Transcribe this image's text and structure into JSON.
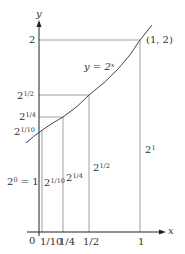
{
  "figure": {
    "curve_label": "y = 2",
    "curve_label_sup": "x",
    "point_label": "(1, 2)",
    "x_axis_label": "x",
    "y_axis_label": "y",
    "origin_label": "0",
    "line_color": "#555555",
    "curve_color": "#444444"
  },
  "y_ticks": [
    {
      "base": "2",
      "sup": "",
      "value": 2
    },
    {
      "base": "2",
      "sup": "1/2",
      "value": 1.414
    },
    {
      "base": "2",
      "sup": "1/4",
      "value": 1.189
    },
    {
      "base": "2",
      "sup": "1/10",
      "value": 1.072
    }
  ],
  "x_ticks": [
    {
      "label": "1/10",
      "value": 0.1
    },
    {
      "label": "1/4",
      "value": 0.25
    },
    {
      "label": "1/2",
      "value": 0.5
    },
    {
      "label": "1",
      "value": 1
    }
  ],
  "vertical_labels": [
    {
      "base": "2",
      "sup": "0",
      "suffix": " = 1"
    },
    {
      "base": "2",
      "sup": "1/10",
      "suffix": ""
    },
    {
      "base": "2",
      "sup": "1/4",
      "suffix": ""
    },
    {
      "base": "2",
      "sup": "1/2",
      "suffix": ""
    },
    {
      "base": "2",
      "sup": "1",
      "suffix": ""
    }
  ]
}
